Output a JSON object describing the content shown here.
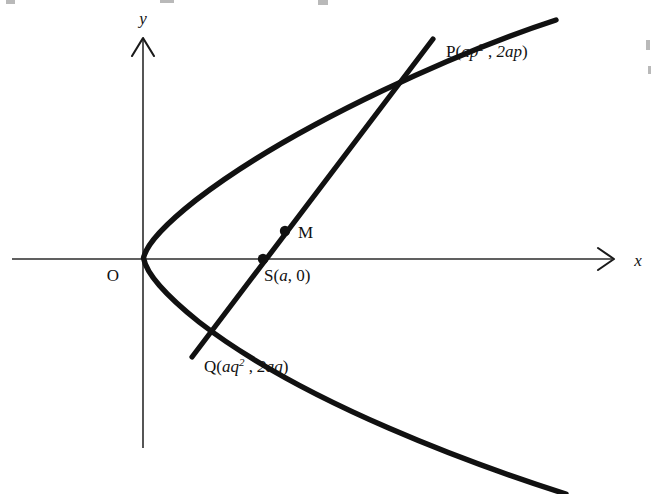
{
  "figure": {
    "background_color": "#ffffff",
    "ink_color": "#111111",
    "axis_color": "#2b2b2b"
  },
  "axes": {
    "x_label": "x",
    "y_label": "y",
    "origin_label": "O",
    "x_axis": {
      "x1": 12,
      "y1": 259,
      "x2": 612,
      "y2": 259
    },
    "y_axis": {
      "x1": 143,
      "y1": 38,
      "x2": 143,
      "y2": 448
    },
    "x_label_pos": {
      "x": 638,
      "y": 266
    },
    "y_label_pos": {
      "x": 137,
      "y": 24
    },
    "origin_label_pos": {
      "x": 113,
      "y": 281
    }
  },
  "curve": {
    "name": "parabola",
    "equation_form": "y^2 = 4ax",
    "vertex": {
      "x": 143,
      "y": 259
    },
    "upper_end": {
      "x": 556,
      "y": 20
    },
    "lower_end": {
      "x": 566,
      "y": 494
    }
  },
  "chord": {
    "name": "focal-chord-PQ",
    "from": {
      "x": 192,
      "y": 357
    },
    "to": {
      "x": 433,
      "y": 39
    }
  },
  "points": [
    {
      "id": "P",
      "label": "P",
      "coord_x": "ap",
      "coord_x_sup": "2",
      "coord_y": "2ap",
      "at": {
        "x": 433,
        "y": 39
      },
      "label_pos": {
        "x": 446,
        "y": 57
      },
      "has_dot": false
    },
    {
      "id": "M",
      "label": "M",
      "coord_x": "",
      "coord_x_sup": "",
      "coord_y": "",
      "at": {
        "x": 285,
        "y": 231
      },
      "label_pos": {
        "x": 298,
        "y": 238
      },
      "has_dot": true
    },
    {
      "id": "S",
      "label": "S",
      "coord_x": "a",
      "coord_x_sup": "",
      "coord_y": "0",
      "at": {
        "x": 263,
        "y": 259
      },
      "label_pos": {
        "x": 264,
        "y": 281
      },
      "has_dot": true
    },
    {
      "id": "Q",
      "label": "Q",
      "coord_x": "aq",
      "coord_x_sup": "2",
      "coord_y": "2aq",
      "at": {
        "x": 192,
        "y": 357
      },
      "label_pos": {
        "x": 204,
        "y": 372
      },
      "has_dot": false
    }
  ],
  "label_text": {
    "P_full": "P(ap2 , 2ap)",
    "Q_full": "Q(aq2 , 2aq)",
    "S_full": "S(a, 0)",
    "M_full": "M",
    "open_paren": "(",
    "close_paren": ")",
    "separator": " , ",
    "separator_simple": ", "
  }
}
